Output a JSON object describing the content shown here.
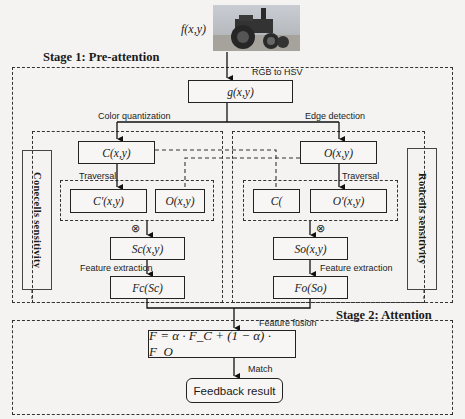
{
  "input": {
    "label": "f(x,y)",
    "image_description": "steam traction engine photo"
  },
  "stage1": {
    "title": "Stage 1: Pre-attention",
    "conversion_label": "RGB to HSV",
    "g_box": "g(x,y)",
    "left_branch": {
      "label": "Color quantization",
      "sidebar": "Conecells sensitivity",
      "top_box": "C(x,y)",
      "traversal_label": "Traversal",
      "traversal_boxes": [
        "C'(x,y)",
        "O(x,y)"
      ],
      "multiply_symbol": "⊗",
      "product_box": "Sc(x,y)",
      "extraction_label": "Feature extraction",
      "feature_box": "Fc(Sc)"
    },
    "right_branch": {
      "label": "Edge detection",
      "sidebar": "Rodcells sensitivity",
      "top_box": "O(x,y)",
      "traversal_label": "Traversal",
      "traversal_boxes": [
        "C(",
        "O'(x,y)"
      ],
      "multiply_symbol": "⊗",
      "product_box": "So(x,y)",
      "extraction_label": "Feature extraction",
      "feature_box": "Fo(So)"
    }
  },
  "stage2": {
    "title": "Stage 2: Attention",
    "fusion_label": "Feature  fusion",
    "formula": "F = α · F_C + (1 − α) · F_O",
    "match_label": "Match",
    "result_box": "Feedback result"
  }
}
